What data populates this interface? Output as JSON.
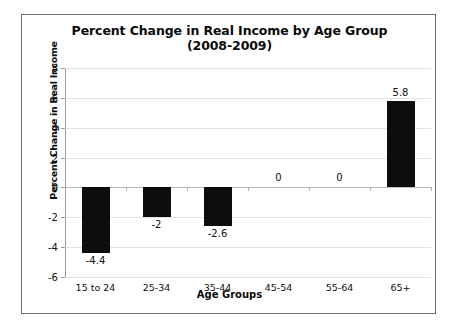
{
  "chart_data": {
    "type": "bar",
    "title": "Percent Change in Real Income by Age Group (2008-2009)",
    "title_line1": "Percent Change in Real Income by Age Group",
    "title_line2": "(2008-2009)",
    "xlabel": "Age Groups",
    "ylabel": "Percent Change in Real Income",
    "categories": [
      "15 to 24",
      "25-34",
      "35-44",
      "45-54",
      "55-64",
      "65+"
    ],
    "values": [
      -4.4,
      -2,
      -2.6,
      0,
      0,
      5.8
    ],
    "value_labels": [
      "-4.4",
      "-2",
      "-2.6",
      "0",
      "0",
      "5.8"
    ],
    "ylim": [
      -6,
      8
    ],
    "ytick_labels": [
      "8",
      "6",
      "4",
      "2",
      "0",
      "-2",
      "-4",
      "-6"
    ],
    "ytick_values": [
      8,
      6,
      4,
      2,
      0,
      -2,
      -4,
      -6
    ],
    "grid": true,
    "legend": false,
    "bar_color": "#0d0d0d",
    "gridline_color": "#e3e3e3",
    "axis_color": "#9a9a9a",
    "frame_color": "#6e6e6e",
    "background_color": "#ffffff"
  }
}
